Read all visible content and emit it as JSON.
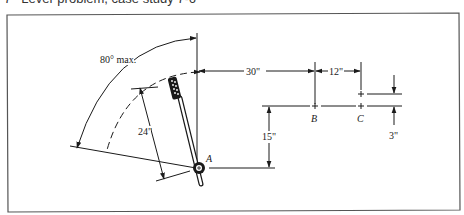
{
  "caption": {
    "number": "7",
    "text": "Lever problem, case study 7-6"
  },
  "diagram": {
    "labels": {
      "angle": "80° max.",
      "lever_length": "24\"",
      "horizontal_to_B": "30\"",
      "B_to_C": "12\"",
      "vertical_A_to_B": "15\"",
      "C_offset": "3\"",
      "point_A": "A",
      "point_B": "B",
      "point_C": "C"
    }
  }
}
